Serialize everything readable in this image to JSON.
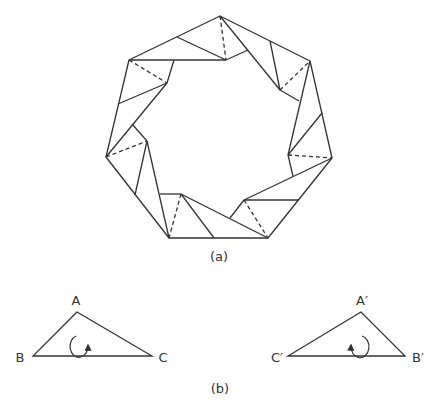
{
  "figure": {
    "part_a": {
      "caption": "(a)",
      "description": "Heptagonal ring tiled by folded triangles with dashed crease lines"
    },
    "part_b": {
      "caption": "(b)",
      "triangle_1": {
        "vertices": {
          "top": "A",
          "left": "B",
          "right": "C"
        },
        "rotation": "clockwise-arrow"
      },
      "triangle_2": {
        "vertices": {
          "top": "A′",
          "left": "C′",
          "right": "B′"
        },
        "rotation": "counterclockwise-arrow"
      }
    },
    "colors": {
      "stroke": "#333333",
      "background": "#ffffff"
    }
  }
}
